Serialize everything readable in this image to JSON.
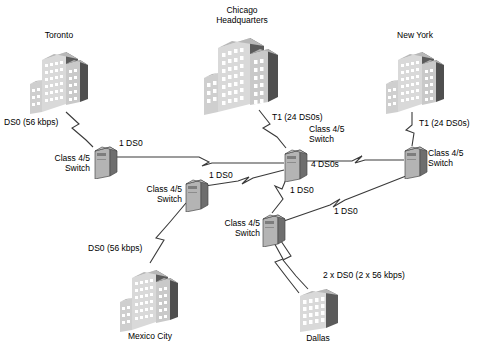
{
  "diagram": {
    "type": "network-topology",
    "palette": {
      "line": "#3a3a3a",
      "building_front": "#d9d9d9",
      "building_side": "#5b5b5b",
      "building_top": "#b8b8b8",
      "window": "#ffffff",
      "switch_front": "#b4b4b4",
      "switch_side": "#6e6e6e",
      "switch_top": "#d2d2d2",
      "text": "#000000",
      "background": "#ffffff"
    }
  },
  "sites": [
    {
      "id": "toronto",
      "label": "Toronto",
      "kind": "building",
      "style": "tower-wing"
    },
    {
      "id": "chicago",
      "label": "Chicago\nHeadquarters",
      "kind": "building",
      "style": "tower-wing-large"
    },
    {
      "id": "newyork",
      "label": "New York",
      "kind": "building",
      "style": "tower-wing"
    },
    {
      "id": "mexico",
      "label": "Mexico City",
      "kind": "building",
      "style": "tower-wing"
    },
    {
      "id": "dallas",
      "label": "Dallas",
      "kind": "building",
      "style": "block"
    }
  ],
  "switches": [
    {
      "id": "sw_toronto",
      "label": "Class 4/5\nSwitch"
    },
    {
      "id": "sw_chicago",
      "label": "Class 4/5\nSwitch"
    },
    {
      "id": "sw_newyork",
      "label": "Class 4/5\nSwitch"
    },
    {
      "id": "sw_mexico",
      "label": "Class 4/5\nSwitch"
    },
    {
      "id": "sw_dallas",
      "label": "Class 4/5\nSwitch"
    }
  ],
  "link_labels": {
    "toronto_access": "DS0 (56 kbps)",
    "chicago_access": "T1 (24 DS0s)",
    "newyork_access": "T1 (24 DS0s)",
    "mexico_access": "DS0 (56 kbps)",
    "dallas_access": "2 x DS0 (2 x 56 kbps)",
    "toronto_chicago": "1 DS0",
    "chicago_newyork": "4 DS0s",
    "mexico_chicago": "1 DS0",
    "chicago_dallas": "1 DS0",
    "dallas_newyork": "1 DS0"
  },
  "links": [
    {
      "id": "toronto-access",
      "from": "toronto",
      "to": "sw_toronto",
      "label": "DS0 (56 kbps)",
      "style": "zigzag"
    },
    {
      "id": "chicago-access",
      "from": "chicago",
      "to": "sw_chicago",
      "label": "T1 (24 DS0s)",
      "style": "zigzag"
    },
    {
      "id": "newyork-access",
      "from": "newyork",
      "to": "sw_newyork",
      "label": "T1 (24 DS0s)",
      "style": "zigzag"
    },
    {
      "id": "mexico-access",
      "from": "mexico",
      "to": "sw_mexico",
      "label": "DS0 (56 kbps)",
      "style": "zigzag"
    },
    {
      "id": "dallas-access",
      "from": "dallas",
      "to": "sw_dallas",
      "label": "2 x DS0 (2 x 56 kbps)",
      "style": "zigzag-double"
    },
    {
      "id": "toronto-chicago",
      "from": "sw_toronto",
      "to": "sw_chicago",
      "label": "1 DS0",
      "style": "zigzag"
    },
    {
      "id": "chicago-newyork",
      "from": "sw_chicago",
      "to": "sw_newyork",
      "label": "4 DS0s",
      "style": "zigzag"
    },
    {
      "id": "mexico-chicago",
      "from": "sw_mexico",
      "to": "sw_chicago",
      "label": "1 DS0",
      "style": "zigzag"
    },
    {
      "id": "chicago-dallas",
      "from": "sw_chicago",
      "to": "sw_dallas",
      "label": "1 DS0",
      "style": "zigzag"
    },
    {
      "id": "dallas-newyork",
      "from": "sw_dallas",
      "to": "sw_newyork",
      "label": "1 DS0",
      "style": "zigzag"
    }
  ]
}
